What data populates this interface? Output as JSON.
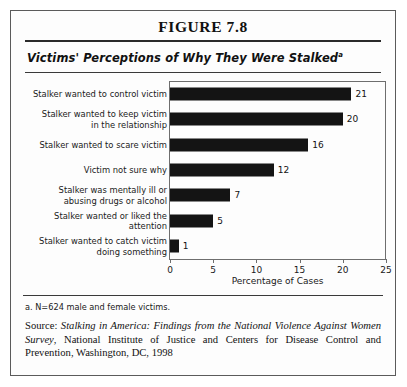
{
  "figure": {
    "title": "FIGURE 7.8",
    "subtitle": "Victims' Perceptions of Why They Were Stalked",
    "subtitle_superscript": "a",
    "footnote": "a. N=624 male and female victims.",
    "source": {
      "label": "Source: ",
      "italic_part_1": "Stalking in America: Findings from the National Violence Against Women Survey",
      "rest": ", National Institute of Justice and Centers for Disease Control and Prevention, Washington, DC, 1998"
    }
  },
  "chart_data": {
    "type": "bar",
    "orientation": "horizontal",
    "title": "Victims' Perceptions of Why They Were Stalked",
    "xlabel": "Percentage of Cases",
    "ylabel": "",
    "xlim": [
      0,
      25
    ],
    "xticks": [
      0,
      5,
      10,
      15,
      20,
      25
    ],
    "xtick_labels": [
      "0",
      "5",
      "10",
      "15",
      "20",
      "25"
    ],
    "grid": false,
    "legend": "none",
    "bar_color": "#141414",
    "categories": [
      "Stalker wanted to control victim",
      "Stalker wanted to keep victim in the relationship",
      "Stalker wanted to scare victim",
      "Victim not sure why",
      "Stalker was mentally ill or abusing drugs or alcohol",
      "Stalker wanted or liked the attention",
      "Stalker wanted to catch victim doing something"
    ],
    "category_lines": [
      [
        "Stalker wanted to control victim"
      ],
      [
        "Stalker wanted to keep victim",
        "in the relationship"
      ],
      [
        "Stalker wanted to scare victim"
      ],
      [
        "Victim not sure why"
      ],
      [
        "Stalker was mentally ill or",
        "abusing drugs or alcohol"
      ],
      [
        "Stalker wanted or liked the",
        "attention"
      ],
      [
        "Stalker wanted to catch victim",
        "doing something"
      ]
    ],
    "values": [
      21,
      20,
      16,
      12,
      7,
      5,
      1
    ],
    "value_labels": [
      "21",
      "20",
      "16",
      "12",
      "7",
      "5",
      "1"
    ]
  }
}
